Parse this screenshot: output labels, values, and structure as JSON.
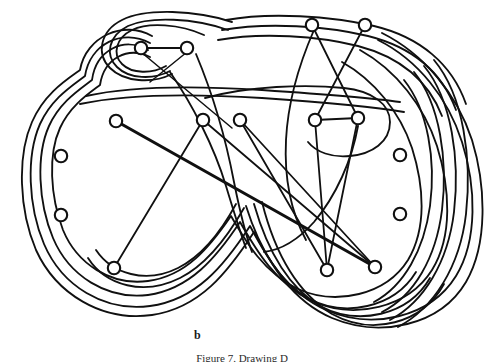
{
  "figure": {
    "panel_label": "b",
    "caption": "Figure 7. Drawing D",
    "colors": {
      "ink": "#101010",
      "background": "#ffffff",
      "vertex_fill": "#ffffff"
    }
  },
  "graph": {
    "vertex_radius": 6.2,
    "vertex_count": 15,
    "vertices": [
      {
        "id": "v1",
        "name": "top-left-inner-a",
        "x": 141,
        "y": 48,
        "r": 6.2
      },
      {
        "id": "v2",
        "name": "top-left-inner-b",
        "x": 187,
        "y": 48,
        "r": 6.2
      },
      {
        "id": "v3",
        "name": "top-right-a",
        "x": 312,
        "y": 25,
        "r": 6.2
      },
      {
        "id": "v4",
        "name": "top-right-b",
        "x": 365,
        "y": 25,
        "r": 6.2
      },
      {
        "id": "v5",
        "name": "mid-left-a",
        "x": 116,
        "y": 121,
        "r": 6.2
      },
      {
        "id": "v6",
        "name": "mid-center-a",
        "x": 203,
        "y": 120,
        "r": 6.2
      },
      {
        "id": "v7",
        "name": "mid-center-b",
        "x": 240,
        "y": 120,
        "r": 6.2
      },
      {
        "id": "v8",
        "name": "mid-right-a",
        "x": 315,
        "y": 120,
        "r": 6.2
      },
      {
        "id": "v9",
        "name": "mid-right-b",
        "x": 358,
        "y": 118,
        "r": 6.2
      },
      {
        "id": "v10",
        "name": "left-isolated-top",
        "x": 61,
        "y": 156,
        "r": 6.2
      },
      {
        "id": "v11",
        "name": "left-isolated-bot",
        "x": 61,
        "y": 215,
        "r": 6.2
      },
      {
        "id": "v12",
        "name": "right-isolated-top",
        "x": 400,
        "y": 155,
        "r": 6.2
      },
      {
        "id": "v13",
        "name": "right-isolated-bot",
        "x": 400,
        "y": 214,
        "r": 6.2
      },
      {
        "id": "v14",
        "name": "bottom-left",
        "x": 114,
        "y": 268,
        "r": 6.2
      },
      {
        "id": "v15",
        "name": "bottom-right-a",
        "x": 327,
        "y": 270,
        "r": 6.2
      },
      {
        "id": "v16",
        "name": "bottom-right-b",
        "x": 375,
        "y": 267,
        "r": 6.2
      }
    ],
    "straight_edges": [
      {
        "from": "v1",
        "to": "v2",
        "weight": "normal"
      },
      {
        "from": "v5",
        "to": "v16",
        "weight": "thick"
      },
      {
        "from": "v6",
        "to": "v14",
        "weight": "normal"
      },
      {
        "from": "v7",
        "to": "v15",
        "weight": "normal"
      },
      {
        "from": "v8",
        "to": "v15",
        "weight": "normal"
      },
      {
        "from": "v8",
        "to": "v9",
        "weight": "normal"
      },
      {
        "from": "v9",
        "to": "v15",
        "weight": "normal"
      },
      {
        "from": "v3",
        "to": "v9",
        "weight": "normal"
      },
      {
        "from": "v4",
        "to": "v8",
        "weight": "normal"
      },
      {
        "from": "v6",
        "to": "v16",
        "weight": "normal"
      },
      {
        "from": "v7",
        "to": "v16",
        "weight": "normal"
      }
    ],
    "nested_curve_count": 6,
    "lobe_layout": "two-lobe figure-eight with nested concentric rings"
  }
}
